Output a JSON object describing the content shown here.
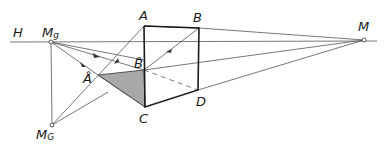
{
  "diagram": {
    "title": "",
    "labels": {
      "horizon": "H",
      "vp_left": "M",
      "vp_left_sub": "g",
      "vp_right": "M",
      "vp_bottom": "M",
      "vp_bottom_sub": "G",
      "point_a": "A",
      "point_b": "B",
      "point_c": "C",
      "point_d": "D",
      "point_a_ring": "Å",
      "point_b_ring": "B̊"
    },
    "points": {
      "Mg": [
        51,
        42
      ],
      "M": [
        364,
        40
      ],
      "MG": [
        52,
        125
      ],
      "A": [
        144,
        26
      ],
      "B": [
        199,
        28
      ],
      "C": [
        145,
        107
      ],
      "D": [
        198,
        90
      ],
      "A_ring": [
        98,
        75
      ],
      "B_ring": [
        144,
        70
      ]
    },
    "colors": {
      "line": "#555555",
      "edge": "#1a1a1a",
      "shade": "#a8a8a8"
    }
  }
}
